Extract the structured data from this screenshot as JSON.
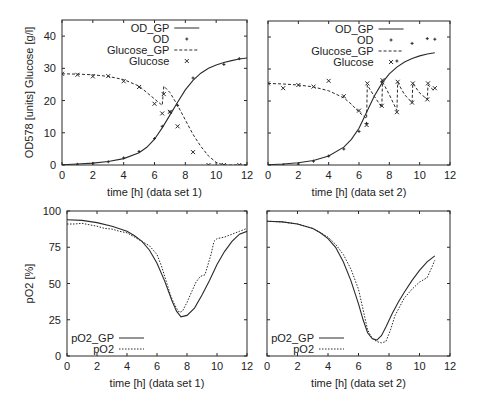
{
  "chart_data": [
    {
      "id": "top-left",
      "type": "line",
      "title": "",
      "xlabel": "time [h]  (data set 1)",
      "ylabel": "OD578 [units]  Glucose [g/l]",
      "xlim": [
        0,
        12
      ],
      "ylim": [
        0,
        45
      ],
      "xticks": [
        0,
        2,
        4,
        6,
        8,
        10,
        12
      ],
      "yticks": [
        0,
        10,
        20,
        30,
        40
      ],
      "grid": false,
      "legend_position": "top-center",
      "frame": {
        "x0": 62,
        "y0": 20,
        "x1": 247,
        "y1": 165
      },
      "show_ytick_labels": true,
      "series": [
        {
          "name": "OD_GP",
          "style": "solid",
          "kind": "line",
          "x": [
            0,
            1,
            2,
            3,
            4,
            5,
            5.5,
            6,
            6.5,
            7,
            7.5,
            8,
            8.5,
            9,
            9.5,
            10,
            10.5,
            11,
            11.5,
            12
          ],
          "y": [
            0.1,
            0.3,
            0.6,
            1.1,
            2.0,
            3.8,
            5.5,
            8.0,
            11.5,
            15.5,
            19.5,
            23.3,
            26.3,
            28.5,
            30.0,
            31.0,
            31.8,
            32.4,
            32.9,
            33.2
          ]
        },
        {
          "name": "OD",
          "style": "dot",
          "kind": "points",
          "marker": "+",
          "x": [
            0,
            1,
            2,
            3,
            4,
            5,
            6,
            6.5,
            7,
            7.5,
            8.5,
            10.5,
            11.5
          ],
          "y": [
            0,
            0.2,
            0.5,
            1.0,
            2.2,
            4.2,
            8.2,
            12.0,
            16.5,
            18.5,
            27.0,
            31.2,
            33.0
          ]
        },
        {
          "name": "Glucose_GP",
          "style": "dashed",
          "kind": "line",
          "x": [
            0,
            1,
            2,
            3,
            4,
            5,
            5.5,
            6,
            6.5,
            6.6,
            7,
            7.5,
            8,
            8.5,
            9,
            9.5,
            10,
            10.5,
            11,
            12
          ],
          "y": [
            28.3,
            28.2,
            28.0,
            27.5,
            26.5,
            24.5,
            22.5,
            20.5,
            18.5,
            24.5,
            22.5,
            18.5,
            14.0,
            9.5,
            5.8,
            2.8,
            0.8,
            0.0,
            0.0,
            0.0
          ]
        },
        {
          "name": "Glucose",
          "style": "x",
          "kind": "points",
          "marker": "x",
          "x": [
            0,
            1,
            2,
            3,
            4,
            5,
            6,
            6.5,
            6.6,
            7,
            7.5,
            8.5,
            9.5,
            10.5,
            11.5
          ],
          "y": [
            28.3,
            28.0,
            27.5,
            27.6,
            26.0,
            24.2,
            19.0,
            16.0,
            22.0,
            16.5,
            12.0,
            4.0,
            0.0,
            0.0,
            0.0
          ]
        }
      ],
      "legend": [
        {
          "label": "OD_GP",
          "style": "solid"
        },
        {
          "label": "OD",
          "style": "plus"
        },
        {
          "label": "Glucose_GP",
          "style": "dashed"
        },
        {
          "label": "Glucose",
          "style": "x"
        }
      ]
    },
    {
      "id": "top-right",
      "type": "line",
      "title": "",
      "xlabel": "time [h]  (data set 2)",
      "ylabel": "",
      "xlim": [
        0,
        12
      ],
      "ylim": [
        0,
        45
      ],
      "xticks": [
        0,
        2,
        4,
        6,
        8,
        10,
        12
      ],
      "yticks": [
        0,
        10,
        20,
        30,
        40
      ],
      "grid": false,
      "legend_position": "top-center",
      "frame": {
        "x0": 268,
        "y0": 21,
        "x1": 450,
        "y1": 165
      },
      "show_ytick_labels": false,
      "series": [
        {
          "name": "OD_GP",
          "style": "solid",
          "kind": "line",
          "x": [
            0,
            1,
            2,
            3,
            4,
            5,
            5.5,
            6,
            6.5,
            7,
            7.5,
            8,
            8.5,
            9,
            9.5,
            10,
            10.5,
            11
          ],
          "y": [
            0.1,
            0.3,
            0.7,
            1.4,
            2.8,
            5.6,
            8.0,
            11.5,
            16.5,
            21.5,
            25.5,
            28.5,
            30.6,
            32.2,
            33.3,
            34.1,
            34.7,
            35.1
          ]
        },
        {
          "name": "OD",
          "style": "dot",
          "kind": "points",
          "marker": "+",
          "x": [
            0,
            1,
            2,
            3,
            4,
            5,
            6,
            6.5,
            7.5,
            8.5,
            9.5,
            10.5,
            11
          ],
          "y": [
            0,
            0.1,
            0.3,
            1.2,
            2.8,
            5.0,
            10.5,
            13.0,
            26.0,
            32.5,
            38.0,
            39.5,
            39.3
          ]
        },
        {
          "name": "Glucose_GP",
          "style": "dashed",
          "kind": "line",
          "x": [
            0,
            1,
            2,
            3,
            4,
            5,
            5.5,
            6,
            6.5,
            6.55,
            7,
            7.5,
            7.55,
            8,
            8.5,
            8.55,
            9,
            9.5,
            9.55,
            10,
            10.5,
            10.55,
            11
          ],
          "y": [
            25.5,
            25.3,
            25.0,
            24.4,
            23.2,
            21.0,
            19.0,
            16.5,
            14.5,
            25.0,
            21.5,
            18.0,
            26.0,
            22.0,
            17.0,
            25.8,
            22.0,
            19.5,
            25.5,
            22.5,
            20.5,
            25.0,
            23.0
          ]
        },
        {
          "name": "Glucose",
          "style": "x",
          "kind": "points",
          "marker": "x",
          "x": [
            0,
            1,
            2,
            3,
            4,
            5,
            6,
            6.5,
            6.55,
            7.5,
            7.55,
            8.5,
            8.55,
            9.5,
            9.55,
            10.5,
            10.55,
            11
          ],
          "y": [
            25.5,
            24.0,
            25.0,
            24.5,
            26.3,
            21.5,
            17.0,
            12.5,
            25.5,
            18.5,
            26.5,
            16.5,
            26.0,
            19.5,
            25.5,
            20.5,
            25.5,
            24.0
          ]
        }
      ],
      "legend": [
        {
          "label": "OD_GP",
          "style": "solid"
        },
        {
          "label": "OD",
          "style": "plus"
        },
        {
          "label": "Glucose_GP",
          "style": "dashed"
        },
        {
          "label": "Glucose",
          "style": "x"
        }
      ]
    },
    {
      "id": "bottom-left",
      "type": "line",
      "title": "",
      "xlabel": "time [h]  (data set 1)",
      "ylabel": "pO2 [%]",
      "xlim": [
        0,
        12
      ],
      "ylim": [
        0,
        100
      ],
      "xticks": [
        0,
        2,
        4,
        6,
        8,
        10,
        12
      ],
      "yticks": [
        0,
        25,
        50,
        75,
        100
      ],
      "grid": false,
      "legend_position": "bottom-left",
      "frame": {
        "x0": 67,
        "y0": 211,
        "x1": 247,
        "y1": 356
      },
      "show_ytick_labels": true,
      "series": [
        {
          "name": "pO2_GP",
          "style": "solid",
          "kind": "line",
          "x": [
            0,
            1,
            2,
            3,
            4,
            4.5,
            5,
            5.5,
            6,
            6.5,
            7,
            7.3,
            7.6,
            8,
            8.5,
            9,
            9.5,
            10,
            10.5,
            11,
            11.5,
            12
          ],
          "y": [
            94,
            93.5,
            92,
            89.5,
            86,
            83,
            79,
            73,
            64,
            52,
            38,
            31,
            27,
            28,
            33,
            42,
            52,
            63,
            72,
            79,
            84,
            86
          ]
        },
        {
          "name": "pO2",
          "style": "dotted",
          "kind": "line",
          "x": [
            0,
            0.5,
            1,
            1.5,
            2,
            2.5,
            3,
            3.5,
            4,
            4.5,
            5,
            5.5,
            6,
            6.3,
            6.6,
            6.9,
            7.1,
            7.3,
            7.5,
            7.7,
            8,
            8.3,
            8.6,
            8.9,
            9.2,
            9.4,
            9.6,
            9.8,
            10,
            10.5,
            11,
            11.5,
            12
          ],
          "y": [
            91,
            91,
            91.5,
            90.5,
            89.5,
            88,
            87.5,
            86,
            85,
            82,
            79,
            76,
            70,
            62,
            52,
            42,
            37,
            33,
            30,
            31,
            37,
            44,
            51,
            55,
            56,
            63,
            70,
            79,
            81,
            82,
            84,
            86,
            88
          ]
        }
      ],
      "legend": [
        {
          "label": "pO2_GP",
          "style": "solid"
        },
        {
          "label": "pO2",
          "style": "dotted"
        }
      ]
    },
    {
      "id": "bottom-right",
      "type": "line",
      "title": "",
      "xlabel": "time [h]  (data set 2)",
      "ylabel": "",
      "xlim": [
        0,
        12
      ],
      "ylim": [
        0,
        100
      ],
      "xticks": [
        0,
        2,
        4,
        6,
        8,
        10,
        12
      ],
      "yticks": [
        0,
        25,
        50,
        75,
        100
      ],
      "grid": false,
      "legend_position": "bottom-left",
      "frame": {
        "x0": 267,
        "y0": 211,
        "x1": 450,
        "y1": 356
      },
      "show_ytick_labels": false,
      "series": [
        {
          "name": "pO2_GP",
          "style": "solid",
          "kind": "line",
          "x": [
            0,
            1,
            2,
            3,
            3.5,
            4,
            4.5,
            5,
            5.5,
            6,
            6.3,
            6.6,
            6.9,
            7.2,
            7.5,
            7.8,
            8.2,
            8.6,
            9,
            9.5,
            10,
            10.5,
            11
          ],
          "y": [
            93,
            92.5,
            91,
            88,
            85,
            81,
            75,
            65,
            52,
            36,
            25,
            16,
            12,
            11,
            14,
            20,
            29,
            37,
            44,
            52,
            59,
            65,
            69
          ]
        },
        {
          "name": "pO2",
          "style": "dotted",
          "kind": "line",
          "x": [
            0,
            1,
            2,
            3,
            3.5,
            4,
            4.5,
            5,
            5.5,
            6,
            6.3,
            6.6,
            6.9,
            7.2,
            7.5,
            7.8,
            8.1,
            8.4,
            8.7,
            9,
            9.5,
            10,
            10.5,
            10.8,
            11
          ],
          "y": [
            93,
            92.5,
            91,
            88,
            85,
            82,
            77,
            70,
            60,
            46,
            32,
            18,
            12,
            10,
            9,
            10,
            18,
            28,
            34,
            40,
            46,
            51,
            54,
            61,
            66
          ]
        }
      ],
      "legend": [
        {
          "label": "pO2_GP",
          "style": "solid"
        },
        {
          "label": "pO2",
          "style": "dotted"
        }
      ]
    }
  ]
}
